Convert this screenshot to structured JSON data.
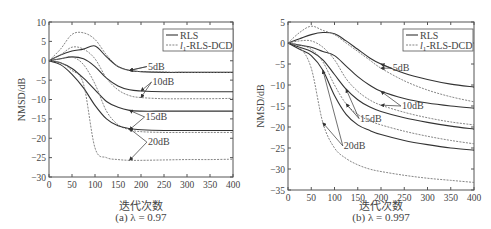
{
  "figure": {
    "xlabel": "迭代次数",
    "ylabel": "NMSD/dB",
    "legend": {
      "rls": "RLS",
      "dcd_prefix": "l",
      "dcd_sub": "1",
      "dcd_suffix": "-RLS-DCD"
    }
  },
  "chart_data": [
    {
      "type": "line",
      "id": "a",
      "title": "(a) λ = 0.97",
      "caption_prefix": "(a) ",
      "caption_lambda": "λ = 0.97",
      "xlabel": "迭代次数",
      "ylabel": "NMSD/dB",
      "xlim": [
        0,
        400
      ],
      "ylim": [
        -30,
        10
      ],
      "xticks": [
        0,
        50,
        100,
        150,
        200,
        250,
        300,
        350,
        400
      ],
      "yticks": [
        10,
        5,
        0,
        -5,
        -10,
        -15,
        -20,
        -25,
        -30
      ],
      "grid": false,
      "legend_position": "upper right",
      "legend": [
        "RLS",
        "l1-RLS-DCD"
      ],
      "x": [
        0,
        25,
        50,
        75,
        100,
        125,
        150,
        175,
        200,
        250,
        300,
        350,
        400
      ],
      "series": [
        {
          "name": "RLS 5dB",
          "style": "solid",
          "values": [
            0,
            1.5,
            2.5,
            3.0,
            3.8,
            1.0,
            -1.5,
            -2.5,
            -2.8,
            -3.0,
            -3.0,
            -3.0,
            -3.0
          ]
        },
        {
          "name": "l1-RLS-DCD 5dB",
          "style": "dashed",
          "values": [
            0,
            3.0,
            6.8,
            7.2,
            5.5,
            1.5,
            -1.5,
            -2.5,
            -2.8,
            -2.9,
            -3.0,
            -3.0,
            -3.0
          ]
        },
        {
          "name": "RLS 10dB",
          "style": "solid",
          "values": [
            0,
            0.5,
            1.0,
            0.5,
            -1.5,
            -4.5,
            -6.5,
            -7.5,
            -7.8,
            -8.0,
            -8.0,
            -8.0,
            -8.0
          ]
        },
        {
          "name": "l1-RLS-DCD 10dB",
          "style": "dashed",
          "values": [
            0,
            1.5,
            3.5,
            3.0,
            0.5,
            -4.5,
            -7.5,
            -9.0,
            -9.5,
            -9.8,
            -9.8,
            -9.8,
            -9.7
          ]
        },
        {
          "name": "RLS 15dB",
          "style": "solid",
          "values": [
            0,
            -0.5,
            -2.0,
            -4.5,
            -7.5,
            -10.5,
            -12.0,
            -12.8,
            -13.0,
            -13.0,
            -13.0,
            -13.0,
            -13.0
          ]
        },
        {
          "name": "l1-RLS-DCD 15dB",
          "style": "dashed",
          "values": [
            0,
            0.5,
            1.0,
            -1.0,
            -6.0,
            -13.0,
            -16.5,
            -17.8,
            -18.3,
            -18.5,
            -18.5,
            -18.5,
            -18.5
          ]
        },
        {
          "name": "RLS 20dB",
          "style": "solid",
          "values": [
            0,
            -1.0,
            -3.5,
            -7.0,
            -11.5,
            -15.0,
            -16.8,
            -17.5,
            -17.8,
            -18.0,
            -18.0,
            -18.0,
            -18.0
          ]
        },
        {
          "name": "l1-RLS-DCD 20dB",
          "style": "dashed",
          "values": [
            0,
            -0.5,
            -2.5,
            -6.0,
            -22.5,
            -25.0,
            -25.5,
            -25.7,
            -25.7,
            -25.6,
            -25.5,
            -25.5,
            -25.4
          ]
        }
      ],
      "annotations": [
        {
          "text": "5dB",
          "x": 215,
          "y": -1.5
        },
        {
          "text": "10dB",
          "x": 225,
          "y": -5.5
        },
        {
          "text": "15dB",
          "x": 210,
          "y": -14.5
        },
        {
          "text": "20dB",
          "x": 215,
          "y": -21.0
        }
      ]
    },
    {
      "type": "line",
      "id": "b",
      "title": "(b) λ = 0.997",
      "caption_prefix": "(b) ",
      "caption_lambda": "λ = 0.997",
      "xlabel": "迭代次数",
      "ylabel": "NMSD/dB",
      "xlim": [
        0,
        400
      ],
      "ylim": [
        -35,
        5
      ],
      "xticks": [
        0,
        50,
        100,
        150,
        200,
        250,
        300,
        350,
        400
      ],
      "yticks": [
        5,
        0,
        -5,
        -10,
        -15,
        -20,
        -25,
        -30,
        -35
      ],
      "grid": false,
      "legend_position": "upper right",
      "legend": [
        "RLS",
        "l1-RLS-DCD"
      ],
      "x": [
        0,
        25,
        50,
        75,
        100,
        125,
        150,
        175,
        200,
        250,
        300,
        350,
        400
      ],
      "series": [
        {
          "name": "RLS 5dB",
          "style": "solid",
          "values": [
            0,
            1.0,
            2.0,
            2.5,
            2.2,
            0.5,
            -1.5,
            -3.5,
            -5.0,
            -7.2,
            -8.7,
            -9.8,
            -10.5
          ]
        },
        {
          "name": "l1-RLS-DCD 5dB",
          "style": "dashed",
          "values": [
            0,
            2.5,
            4.0,
            3.0,
            2.0,
            0.0,
            -2.0,
            -4.0,
            -6.0,
            -9.0,
            -11.2,
            -12.8,
            -14.0
          ]
        },
        {
          "name": "RLS 10dB",
          "style": "solid",
          "values": [
            0,
            -0.5,
            -1.0,
            -2.0,
            -3.0,
            -5.5,
            -8.0,
            -10.0,
            -11.5,
            -13.2,
            -14.3,
            -15.0,
            -15.5
          ]
        },
        {
          "name": "l1-RLS-DCD 10dB",
          "style": "dashed",
          "values": [
            0,
            0.5,
            0.5,
            -1.0,
            -4.0,
            -8.5,
            -11.5,
            -13.5,
            -14.8,
            -16.5,
            -17.8,
            -18.8,
            -19.5
          ]
        },
        {
          "name": "RLS 15dB",
          "style": "solid",
          "values": [
            0,
            -1.0,
            -2.0,
            -4.0,
            -7.5,
            -11.0,
            -13.5,
            -15.2,
            -16.3,
            -17.8,
            -18.9,
            -19.8,
            -20.5
          ]
        },
        {
          "name": "l1-RLS-DCD 15dB",
          "style": "dashed",
          "values": [
            0,
            -0.5,
            -1.5,
            -4.5,
            -10.0,
            -14.5,
            -17.0,
            -18.5,
            -19.5,
            -21.0,
            -22.2,
            -23.2,
            -24.0
          ]
        },
        {
          "name": "RLS 20dB",
          "style": "solid",
          "values": [
            0,
            -1.5,
            -3.0,
            -6.5,
            -12.5,
            -17.0,
            -19.5,
            -20.8,
            -21.8,
            -23.2,
            -24.2,
            -25.0,
            -25.5
          ]
        },
        {
          "name": "l1-RLS-DCD 20dB",
          "style": "dashed",
          "values": [
            0,
            -1.0,
            -6.0,
            -19.0,
            -25.0,
            -27.5,
            -29.0,
            -30.0,
            -30.6,
            -31.5,
            -32.2,
            -32.7,
            -33.2
          ]
        }
      ],
      "annotations": [
        {
          "text": "5dB",
          "x": 225,
          "y": -6.0
        },
        {
          "text": "10dB",
          "x": 245,
          "y": -15.0
        },
        {
          "text": "15dB",
          "x": 155,
          "y": -18.0
        },
        {
          "text": "20dB",
          "x": 120,
          "y": -24.5
        }
      ]
    }
  ]
}
